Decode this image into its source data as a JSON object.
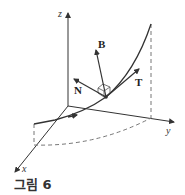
{
  "figure": {
    "caption": "그림 6",
    "axes": {
      "x_label": "x",
      "y_label": "y",
      "z_label": "z"
    },
    "vectors": {
      "tangent": "T",
      "normal": "N",
      "binormal": "B"
    },
    "colors": {
      "line": "#333333",
      "dashed": "#777777",
      "background": "#ffffff"
    }
  }
}
